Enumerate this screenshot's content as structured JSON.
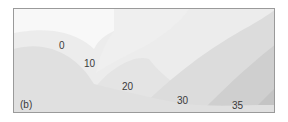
{
  "panel_label": "(b)",
  "contour_labels": [
    {
      "text": "0"
    },
    {
      "text": "10"
    },
    {
      "text": "20"
    },
    {
      "text": "30"
    },
    {
      "text": "35"
    }
  ],
  "colors": {
    "frame": "#9a9a9a",
    "region_white": "#f7f7f7",
    "region_0": "#e2e2e2",
    "region_10": "#ececec",
    "region_20": "#dedede",
    "region_30": "#d2d2d2",
    "region_35": "#c6c6c6"
  }
}
